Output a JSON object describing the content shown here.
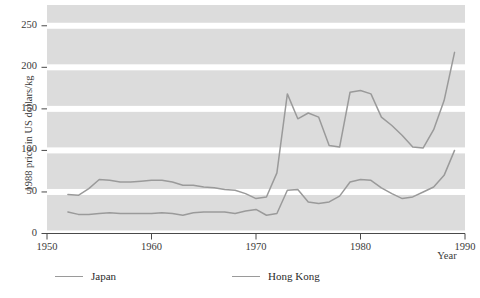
{
  "chart_data": {
    "type": "line",
    "title": "",
    "xlabel": "Year",
    "ylabel": "1988 price in US dollars/kg",
    "xlim": [
      1950,
      1990
    ],
    "ylim": [
      0,
      275
    ],
    "xticks": [
      1950,
      1960,
      1970,
      1980,
      1990
    ],
    "yticks": [
      0,
      50,
      100,
      150,
      200,
      250
    ],
    "grid": "horizontal-bands",
    "legend_position": "below",
    "series": [
      {
        "name": "Japan",
        "color": "#9a9a9a",
        "x": [
          1952,
          1953,
          1954,
          1955,
          1956,
          1957,
          1958,
          1959,
          1960,
          1961,
          1962,
          1963,
          1964,
          1965,
          1966,
          1967,
          1968,
          1969,
          1970,
          1971,
          1972,
          1973,
          1974,
          1975,
          1976,
          1977,
          1978,
          1979,
          1980,
          1981,
          1982,
          1983,
          1984,
          1985,
          1986,
          1987,
          1988,
          1989
        ],
        "values": [
          47,
          46,
          54,
          65,
          64,
          62,
          62,
          63,
          64,
          64,
          62,
          58,
          58,
          56,
          55,
          53,
          52,
          48,
          42,
          44,
          73,
          168,
          138,
          145,
          140,
          106,
          104,
          170,
          172,
          168,
          140,
          130,
          118,
          104,
          103,
          125,
          160,
          218
        ]
      },
      {
        "name": "Hong Kong",
        "color": "#9a9a9a",
        "x": [
          1952,
          1953,
          1954,
          1955,
          1956,
          1957,
          1958,
          1959,
          1960,
          1961,
          1962,
          1963,
          1964,
          1965,
          1966,
          1967,
          1968,
          1969,
          1970,
          1971,
          1972,
          1973,
          1974,
          1975,
          1976,
          1977,
          1978,
          1979,
          1980,
          1981,
          1982,
          1983,
          1984,
          1985,
          1986,
          1987,
          1988,
          1989
        ],
        "values": [
          26,
          23,
          23,
          24,
          25,
          24,
          24,
          24,
          24,
          25,
          24,
          22,
          25,
          26,
          26,
          26,
          24,
          27,
          29,
          22,
          24,
          52,
          53,
          38,
          36,
          38,
          45,
          62,
          65,
          64,
          55,
          48,
          42,
          44,
          50,
          56,
          70,
          100
        ]
      }
    ]
  },
  "axes": {
    "ylabel": "1988 price in US dollars/kg",
    "xlabel": "Year",
    "yticks": [
      "0",
      "50",
      "100",
      "150",
      "200",
      "250"
    ],
    "xticks": [
      "1950",
      "1960",
      "1970",
      "1980",
      "1990"
    ]
  },
  "legend": {
    "entries": [
      {
        "label": "Japan",
        "color": "#9a9a9a"
      },
      {
        "label": "Hong Kong",
        "color": "#9a9a9a"
      }
    ]
  },
  "colors": {
    "band": "#dcdcdc",
    "line": "#9a9a9a",
    "axis": "#4a4a4a",
    "text": "#2b2b2b",
    "background": "#ffffff"
  }
}
